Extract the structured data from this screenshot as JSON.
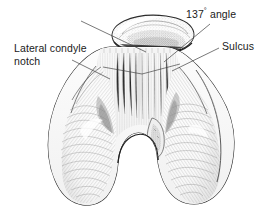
{
  "figure": {
    "kind": "anatomical-line-drawing",
    "background_color": "#ffffff",
    "ink_color": "#1a1a1a",
    "leader_line_color": "#4a4a4a",
    "shading_color": "#8c8c8c"
  },
  "labels": {
    "angle": {
      "value": "137",
      "degree_symbol": "°",
      "word": " angle",
      "full": "137° angle"
    },
    "sulcus": {
      "text": "Sulcus"
    },
    "lateral_condyle_notch": {
      "line1": "Lateral condyle",
      "line2": "notch",
      "full": "Lateral condyle notch"
    }
  },
  "structures": {
    "patella": "patella",
    "trochlear_groove": "trochlear-groove",
    "medial_condyle": "medial-condyle",
    "lateral_condyle": "lateral-condyle",
    "intercondylar_notch": "intercondylar-notch",
    "sulcus_angle_lines": "sulcus-angle-measurement-lines"
  }
}
